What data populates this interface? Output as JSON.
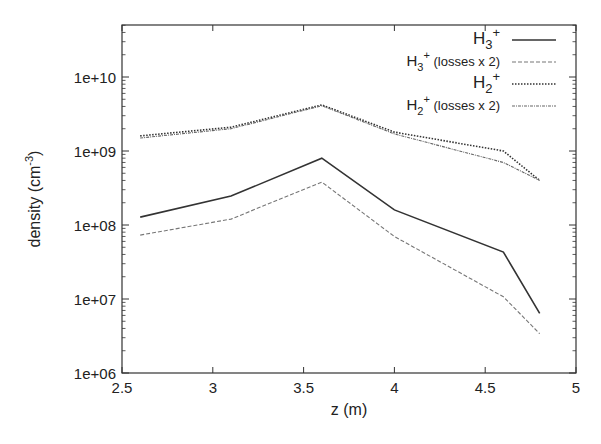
{
  "chart_data": {
    "type": "line",
    "title": "",
    "xlabel": "z (m)",
    "ylabel": "density (cm^-3)",
    "xlim": [
      2.5,
      5
    ],
    "ylim": [
      1000000.0,
      50000000000.0
    ],
    "yscale": "log",
    "grid": false,
    "legend_position": "top-right",
    "xticks": [
      "2.5",
      "3",
      "3.5",
      "4",
      "4.5",
      "5"
    ],
    "yticks": [
      "1e+06",
      "1e+07",
      "1e+08",
      "1e+09",
      "1e+10"
    ],
    "x": [
      2.6,
      3.1,
      3.6,
      4.0,
      4.6,
      4.8
    ],
    "series": [
      {
        "name": "H3+",
        "legend_main": "H",
        "legend_sub": "3",
        "legend_sup": "+",
        "legend_extra": "",
        "style": "solid",
        "values": [
          128000000.0,
          246000000.0,
          800000000.0,
          160000000.0,
          43000000.0,
          6400000.0
        ]
      },
      {
        "name": "H3+ (losses x 2)",
        "legend_main": "H",
        "legend_sub": "3",
        "legend_sup": "+",
        "legend_extra": " (losses x 2)",
        "style": "dashed",
        "values": [
          73000000.0,
          120000000.0,
          380000000.0,
          70000000.0,
          10700000.0,
          3400000.0
        ]
      },
      {
        "name": "H2+",
        "legend_main": "H",
        "legend_sub": "2",
        "legend_sup": "+",
        "legend_extra": "",
        "style": "dotted",
        "values": [
          1600000000.0,
          2100000000.0,
          4200000000.0,
          1800000000.0,
          1000000000.0,
          400000000.0
        ]
      },
      {
        "name": "H2+ (losses x 2)",
        "legend_main": "H",
        "legend_sub": "2",
        "legend_sup": "+",
        "legend_extra": " (losses x 2)",
        "style": "dashdot",
        "values": [
          1500000000.0,
          2000000000.0,
          4100000000.0,
          1700000000.0,
          700000000.0,
          400000000.0
        ]
      }
    ]
  },
  "axis": {
    "ylabel_main": "density (cm",
    "ylabel_sup": "-3",
    "ylabel_close": ")"
  }
}
